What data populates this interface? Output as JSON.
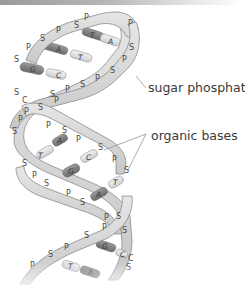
{
  "labels": {
    "sugar_phosphate": "sugar phosphate",
    "organic_bases": "organic bases"
  },
  "strand_units": [
    "S",
    "P"
  ],
  "base_pairs": [
    {
      "left": "T",
      "right": "A"
    },
    {
      "left": "A",
      "right": "T"
    },
    {
      "left": "G",
      "right": "C"
    },
    {
      "left": "A",
      "right": "T"
    },
    {
      "left": "G",
      "right": "C"
    },
    {
      "left": "T",
      "right": "A"
    },
    {
      "left": "G",
      "right": "C"
    },
    {
      "left": "T",
      "right": "A"
    }
  ],
  "colors": {
    "ribbon_fill": "#d8d8d8",
    "ribbon_edge": "#8a8a8a",
    "base_dark": "#7a7a7a",
    "base_light": "#e0e0e0",
    "leader_line": "#8a8a8a",
    "label_text": "#3a3a3a"
  }
}
